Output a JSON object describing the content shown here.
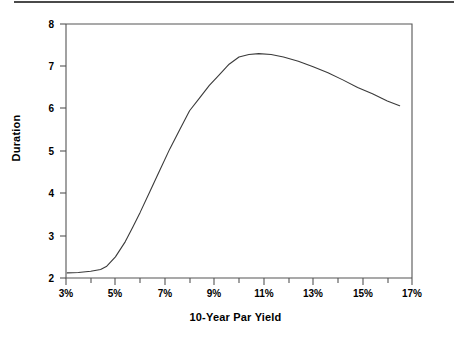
{
  "figure": {
    "background_color": "#ffffff",
    "line_color": "#3a3a3a",
    "axis_color": "#555555",
    "rule_color": "#4a4a4a"
  },
  "chart_data": {
    "type": "line",
    "title": "",
    "xlabel": "10-Year Par Yield",
    "ylabel": "Duration",
    "xlim": [
      3,
      17
    ],
    "ylim": [
      2,
      8
    ],
    "grid": false,
    "legend": null,
    "x_tick_labels": [
      "3%",
      "5%",
      "7%",
      "9%",
      "11%",
      "13%",
      "15%",
      "17%"
    ],
    "x_tick_values": [
      3,
      5,
      7,
      9,
      11,
      13,
      15,
      17
    ],
    "x_minor_tick_values": [
      4,
      6,
      8,
      10,
      12,
      14,
      16
    ],
    "y_tick_labels": [
      "2",
      "3",
      "4",
      "5",
      "6",
      "7",
      "8"
    ],
    "y_tick_values": [
      2,
      3,
      4,
      5,
      6,
      7,
      8
    ],
    "x_unit": "%",
    "series": [
      {
        "name": "Duration",
        "x": [
          3.05,
          3.5,
          4.0,
          4.4,
          4.65,
          5.0,
          5.4,
          5.7,
          6.0,
          6.4,
          6.8,
          7.2,
          7.6,
          8.0,
          8.4,
          8.8,
          9.2,
          9.6,
          10.0,
          10.4,
          10.8,
          11.3,
          11.8,
          12.4,
          13.0,
          13.6,
          14.2,
          14.8,
          15.4,
          16.0,
          16.5
        ],
        "y": [
          2.12,
          2.13,
          2.16,
          2.2,
          2.28,
          2.5,
          2.86,
          3.2,
          3.55,
          4.05,
          4.55,
          5.05,
          5.5,
          5.95,
          6.25,
          6.55,
          6.8,
          7.05,
          7.22,
          7.28,
          7.3,
          7.28,
          7.22,
          7.12,
          6.99,
          6.85,
          6.68,
          6.5,
          6.35,
          6.18,
          6.07
        ]
      }
    ],
    "annotations": {
      "start_value": 2.12,
      "peak_value": 7.3,
      "peak_x": 10.8,
      "end_value": 6.07,
      "end_x": 16.5
    }
  }
}
